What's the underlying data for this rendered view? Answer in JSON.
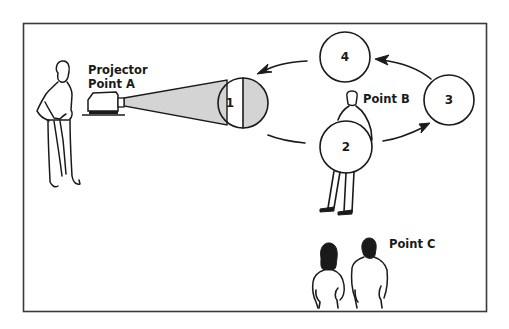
{
  "diagram": {
    "colors": {
      "line": "#1a1a1a",
      "beam_fill": "#d4d4d4",
      "background": "#ffffff",
      "frame": "#3a3a3a"
    },
    "labels": {
      "projector": "Projector",
      "point_a": "Point A",
      "point_b": "Point B",
      "point_c": "Point C"
    },
    "positions": [
      {
        "id": "1",
        "label": "1",
        "note": "screen facing projector (half shaded)"
      },
      {
        "id": "2",
        "label": "2",
        "note": "held by person at Point B"
      },
      {
        "id": "3",
        "label": "3"
      },
      {
        "id": "4",
        "label": "4"
      }
    ],
    "flow": [
      "1",
      "2",
      "3",
      "4",
      "1"
    ],
    "icons": {
      "presenter": "standing-person-icon",
      "projector": "projector-icon",
      "carrier": "person-holding-screen-icon",
      "audience": "audience-pair-icon"
    }
  }
}
